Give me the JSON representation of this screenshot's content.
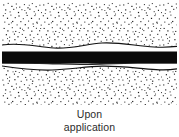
{
  "figure": {
    "caption_line1": "Upon",
    "caption_line2": "application",
    "colors": {
      "background": "#ffffff",
      "stipple_dot": "#1a1a1a",
      "band_fill": "#0b0b0b",
      "boundary_line": "#111111",
      "caption_text": "#2b2b2b"
    }
  },
  "diagram": {
    "type": "cross-section",
    "layers": [
      {
        "name": "upper-stipple-region",
        "label": "upper granular layer",
        "fill": "stipple",
        "top": 0,
        "bottom": 44
      },
      {
        "name": "upper-gap",
        "label": "white gap above band",
        "fill": "white",
        "top": 44,
        "bottom": 49
      },
      {
        "name": "black-band",
        "label": "solid dark band",
        "fill": "solid-black",
        "top": 49,
        "bottom": 61
      },
      {
        "name": "lower-gap",
        "label": "white gap below band",
        "fill": "white",
        "top": 61,
        "bottom": 66
      },
      {
        "name": "lower-stipple-region",
        "label": "lower granular layer",
        "fill": "stipple",
        "top": 66,
        "bottom": 103
      }
    ],
    "boundaries": [
      {
        "name": "upper-wavy-boundary",
        "path": "M0,43 C20,40 34,45 52,46 C70,47 84,42 100,41 C118,40 134,44 152,45 C163,45.6 170,45 175,44.4"
      },
      {
        "name": "lower-wavy-boundary",
        "path": "M0,64 C16,66.5 32,68.5 50,68 C68,67.5 84,64.5 100,64.2 C118,63.9 136,66.5 154,67.6 C164,68.2 170,67.6 175,66.8"
      }
    ]
  }
}
